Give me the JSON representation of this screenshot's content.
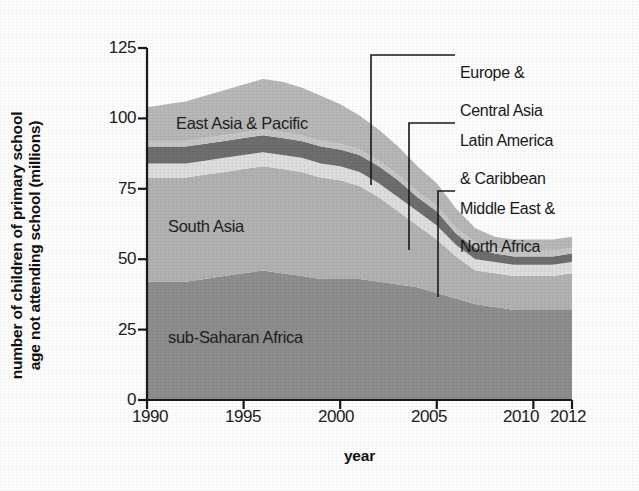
{
  "chart_data": {
    "type": "area",
    "title": "",
    "xlabel": "year",
    "ylabel": "number of children of primary school\nage not attending school (millions)",
    "ylabel_line1": "number of children of primary school",
    "ylabel_line2": "age not attending school (millions)",
    "stacked": true,
    "grid": false,
    "legend_position": "in-plot-and-callouts",
    "xlim": [
      1990,
      2012
    ],
    "ylim": [
      0,
      125
    ],
    "xticks": [
      1990,
      1995,
      2000,
      2005,
      2010,
      2012
    ],
    "xticklabels": [
      "1990",
      "1995",
      "2000",
      "2005",
      "2010",
      "2012"
    ],
    "yticks": [
      0,
      25,
      50,
      75,
      100,
      125
    ],
    "yticklabels": [
      "0",
      "25",
      "50",
      "75",
      "100",
      "125"
    ],
    "x": [
      1990,
      1991,
      1992,
      1993,
      1994,
      1995,
      1996,
      1997,
      1998,
      1999,
      2000,
      2001,
      2002,
      2003,
      2004,
      2005,
      2006,
      2007,
      2008,
      2009,
      2010,
      2011,
      2012
    ],
    "series": [
      {
        "name": "sub-Saharan Africa",
        "color": "#8e8e8e",
        "values": [
          42,
          42,
          42,
          43,
          44,
          45,
          46,
          45,
          44,
          43,
          43,
          43,
          42,
          41,
          40,
          38,
          36,
          34,
          33,
          32,
          32,
          32,
          32
        ]
      },
      {
        "name": "South Asia",
        "color": "#b2b2b2",
        "values": [
          37,
          37,
          37,
          37,
          37,
          37,
          37,
          37,
          37,
          36,
          35,
          33,
          30,
          26,
          22,
          19,
          15,
          12,
          12,
          12,
          12,
          12,
          13
        ]
      },
      {
        "name": "Middle East & North Africa",
        "color": "#dedede",
        "values": [
          5,
          5,
          5,
          5,
          5,
          5,
          5,
          5,
          5,
          5,
          5,
          5,
          5,
          5,
          5,
          5,
          4,
          4,
          4,
          4,
          4,
          4,
          4
        ]
      },
      {
        "name": "Latin America & Caribbean",
        "color": "#6f6f6f",
        "values": [
          6,
          6,
          6,
          6,
          6,
          6,
          6,
          6,
          6,
          6,
          6,
          6,
          6,
          6,
          5,
          5,
          4,
          4,
          3,
          3,
          3,
          3,
          3
        ]
      },
      {
        "name": "Europe & Central Asia",
        "color": "#c6c6c6",
        "values": [
          2,
          2,
          2,
          2,
          2,
          2,
          2,
          2,
          2,
          2,
          2,
          2,
          2,
          2,
          2,
          2,
          2,
          2,
          2,
          2,
          2,
          2,
          2
        ]
      },
      {
        "name": "East Asia & Pacific",
        "color": "#b8b8b8",
        "values": [
          12,
          13,
          14,
          15,
          16,
          17,
          18,
          18,
          17,
          16,
          14,
          12,
          11,
          10,
          9,
          8,
          7,
          5,
          4,
          4,
          4,
          4,
          4
        ]
      }
    ],
    "totals_note": "values are millions of out-of-school children, stacked"
  },
  "labels": {
    "in_plot": [
      {
        "text": "East Asia & Pacific",
        "series": "East Asia & Pacific"
      },
      {
        "text": "South Asia",
        "series": "South Asia"
      },
      {
        "text": "sub-Saharan Africa",
        "series": "sub-Saharan Africa"
      }
    ],
    "callouts": [
      {
        "line1": "Europe &",
        "line2": "Central Asia",
        "series": "Europe & Central Asia"
      },
      {
        "line1": "Latin America",
        "line2": "& Caribbean",
        "series": "Latin America & Caribbean"
      },
      {
        "line1": "Middle East &",
        "line2": "North Africa",
        "series": "Middle East & North Africa"
      }
    ]
  },
  "axis": {
    "x_title": "year",
    "y_title_line1": "number of children of primary school",
    "y_title_line2": "age not attending school (millions)"
  },
  "colors": {
    "axis": "#1a1a1a",
    "text": "#1a1a1a",
    "background": "#ffffff",
    "sub_saharan_africa": "#8e8e8e",
    "south_asia": "#b2b2b2",
    "middle_east_north_africa": "#dedede",
    "latin_america_caribbean": "#6f6f6f",
    "europe_central_asia": "#c6c6c6",
    "east_asia_pacific": "#b8b8b8"
  }
}
